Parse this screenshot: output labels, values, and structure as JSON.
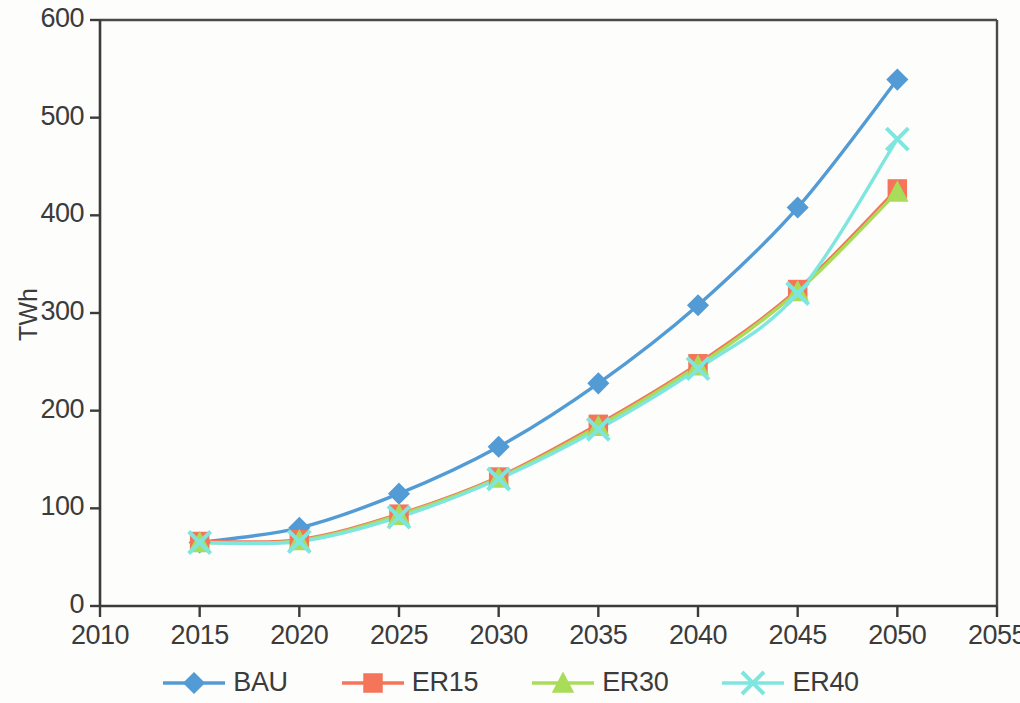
{
  "chart_data": {
    "type": "line",
    "title": "",
    "subtitle": "",
    "xlabel": "",
    "ylabel": "TWh",
    "x": [
      2015,
      2020,
      2025,
      2030,
      2035,
      2040,
      2045,
      2050
    ],
    "xlim": [
      2010,
      2055
    ],
    "ylim": [
      0,
      600
    ],
    "xticks": [
      2010,
      2015,
      2020,
      2025,
      2030,
      2035,
      2040,
      2045,
      2050,
      2055
    ],
    "yticks": [
      0,
      100,
      200,
      300,
      400,
      500,
      600
    ],
    "xtick_labels": [
      "2010",
      "2015",
      "2020",
      "2025",
      "2030",
      "2035",
      "2040",
      "2045",
      "2050",
      "2055"
    ],
    "ytick_labels": [
      "0",
      "100",
      "200",
      "300",
      "400",
      "500",
      "600"
    ],
    "grid": false,
    "legend_position": "bottom",
    "series": [
      {
        "name": "BAU",
        "color": "#539BD5",
        "marker": "diamond",
        "values": [
          65,
          80,
          115,
          163,
          228,
          308,
          408,
          539
        ]
      },
      {
        "name": "ER15",
        "color": "#F4755A",
        "marker": "square",
        "values": [
          66,
          68,
          94,
          132,
          186,
          248,
          324,
          427
        ]
      },
      {
        "name": "ER30",
        "color": "#A9DC59",
        "marker": "triangle",
        "values": [
          65,
          67,
          93,
          131,
          184,
          246,
          322,
          424
        ]
      },
      {
        "name": "ER40",
        "color": "#7FE6DF",
        "marker": "cross",
        "values": [
          65,
          66,
          91,
          130,
          181,
          243,
          320,
          478
        ]
      }
    ]
  },
  "axes": {
    "y_axis_title": "TWh",
    "axis_color": "#3b3b3b"
  },
  "legend": {
    "entries": [
      {
        "label": "BAU",
        "color": "#539BD5",
        "marker": "diamond"
      },
      {
        "label": "ER15",
        "color": "#F4755A",
        "marker": "square"
      },
      {
        "label": "ER30",
        "color": "#A9DC59",
        "marker": "triangle"
      },
      {
        "label": "ER40",
        "color": "#7FE6DF",
        "marker": "cross"
      }
    ]
  }
}
